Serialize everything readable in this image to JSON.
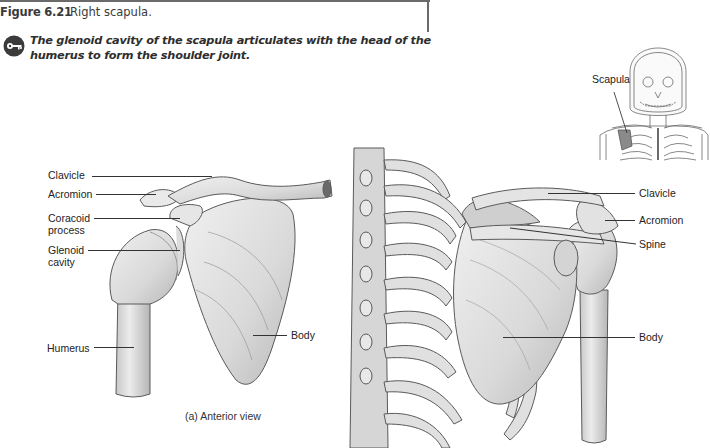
{
  "figure": {
    "number": "Figure 6.21",
    "title": "Right scapula.",
    "key_icon": "key-icon",
    "key_statement": "The glenoid cavity of the scapula articulates with the head of the humerus to form the shoulder joint."
  },
  "inset": {
    "label": "Scapula",
    "description": "Anterior skeleton of head and thorax with right scapula highlighted"
  },
  "anterior_view": {
    "caption": "(a) Anterior view",
    "labels": [
      {
        "id": "clavicle",
        "text": "Clavicle"
      },
      {
        "id": "acromion",
        "text": "Acromion"
      },
      {
        "id": "coracoid",
        "text": "Coracoid\nprocess",
        "line1": "Coracoid",
        "line2": "process"
      },
      {
        "id": "glenoid",
        "text": "Glenoid\ncavity",
        "line1": "Glenoid",
        "line2": "cavity"
      },
      {
        "id": "humerus",
        "text": "Humerus"
      },
      {
        "id": "body",
        "text": "Body"
      }
    ]
  },
  "posterior_view": {
    "labels": [
      {
        "id": "clavicle",
        "text": "Clavicle"
      },
      {
        "id": "acromion",
        "text": "Acromion"
      },
      {
        "id": "spine",
        "text": "Spine"
      },
      {
        "id": "body",
        "text": "Body"
      }
    ]
  },
  "colors": {
    "bone_fill": "#e4e4e4",
    "bone_shade": "#bdbdbd",
    "bone_outline": "#5a5a5a",
    "highlight": "#8a8a8a",
    "text": "#222222",
    "rule": "#6a6a6a"
  }
}
